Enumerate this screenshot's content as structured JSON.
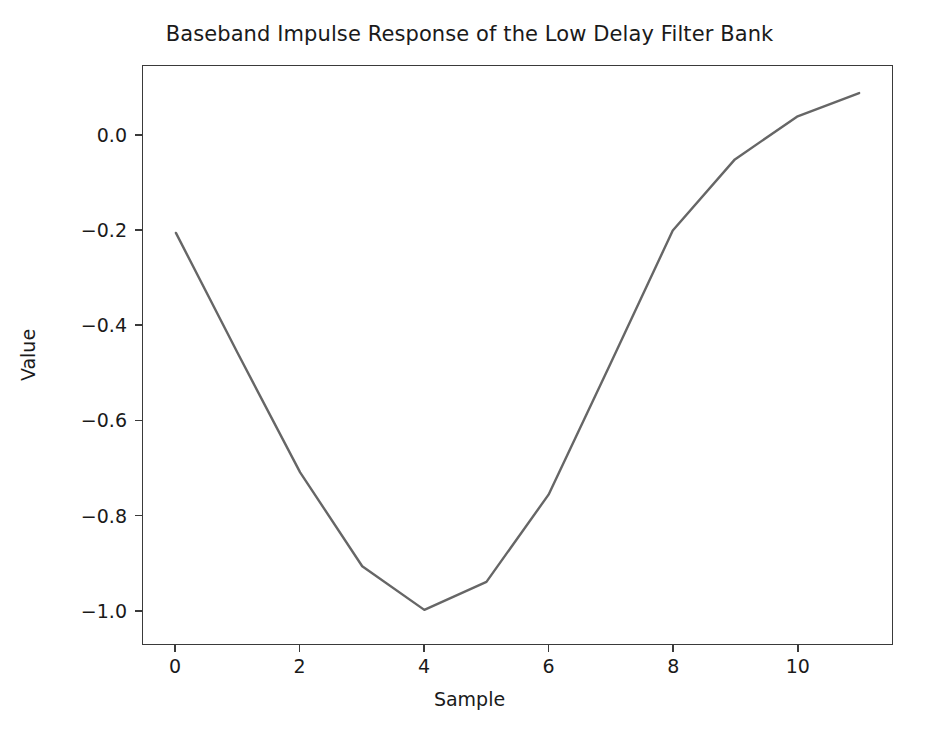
{
  "chart_data": {
    "type": "line",
    "title": "Baseband Impulse Response of the Low Delay Filter Bank",
    "xlabel": "Sample",
    "ylabel": "Value",
    "x": [
      0,
      1,
      2,
      3,
      4,
      5,
      6,
      7,
      8,
      9,
      10,
      11
    ],
    "values": [
      -0.205,
      -0.46,
      -0.71,
      -0.908,
      -1.0,
      -0.941,
      -0.757,
      -0.48,
      -0.2,
      -0.05,
      0.04,
      0.09
    ],
    "series": [
      {
        "name": "impulse-response",
        "values": [
          -0.205,
          -0.46,
          -0.71,
          -0.908,
          -1.0,
          -0.941,
          -0.757,
          -0.48,
          -0.2,
          -0.05,
          0.04,
          0.09
        ]
      }
    ],
    "xlim": [
      -0.53,
      11.53
    ],
    "ylim": [
      -1.072,
      0.147
    ],
    "xticks": [
      0,
      2,
      4,
      6,
      8,
      10
    ],
    "xtick_labels": [
      "0",
      "2",
      "4",
      "6",
      "8",
      "10"
    ],
    "yticks": [
      0.0,
      -0.2,
      -0.4,
      -0.6,
      -0.8,
      -1.0
    ],
    "ytick_labels": [
      "0.0",
      "−0.2",
      "−0.4",
      "−0.6",
      "−0.8",
      "−1.0"
    ],
    "grid": false,
    "legend": null,
    "line_color": "#666666",
    "line_width": 2.4,
    "background_color": "#ffffff",
    "axes_color": "#3a3a3a"
  }
}
